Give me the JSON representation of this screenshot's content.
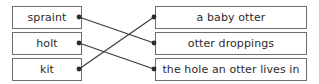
{
  "exercise": {
    "type": "matching-activity",
    "left_column": {
      "items": [
        {
          "id": "spraint",
          "label": "spraint",
          "row": 1
        },
        {
          "id": "holt",
          "label": "holt",
          "row": 2
        },
        {
          "id": "kit",
          "label": "kit",
          "row": 3
        }
      ]
    },
    "right_column": {
      "items": [
        {
          "id": "a-baby-otter",
          "label": "a baby otter",
          "row": 1
        },
        {
          "id": "otter-droppings",
          "label": "otter droppings",
          "row": 2
        },
        {
          "id": "otter-hole",
          "label": "the hole an otter lives in",
          "row": 3
        }
      ]
    },
    "connections": [
      {
        "from": "spraint",
        "to": "otter-droppings",
        "x1": 79,
        "y1": 17,
        "x2": 154,
        "y2": 43
      },
      {
        "from": "holt",
        "to": "otter-hole",
        "x1": 79,
        "y1": 43,
        "x2": 154,
        "y2": 69
      },
      {
        "from": "kit",
        "to": "a-baby-otter",
        "x1": 79,
        "y1": 69,
        "x2": 154,
        "y2": 17
      }
    ],
    "colors": {
      "box_border": "#6e6e6e",
      "box_fill": "#ffffff",
      "text": "#2b2b2b",
      "line": "#3a3a3a",
      "dot": "#2b2b2b",
      "background": "#ffffff"
    }
  }
}
